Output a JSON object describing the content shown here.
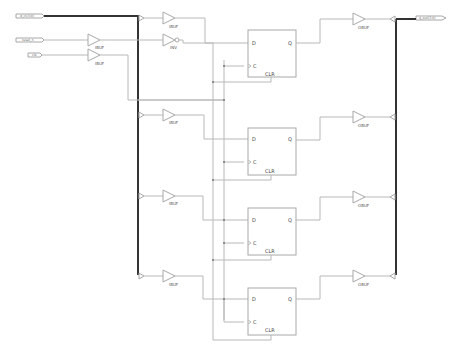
{
  "schematic": {
    "ports": {
      "in_bus": "d_in(3:0)",
      "reset": "reset_n",
      "clock": "clk",
      "out_bus": "q_out(3:0)"
    },
    "cells": {
      "ibuf": "IBUF",
      "inv": "INV",
      "obuf": "OBUF"
    },
    "flipflop": {
      "d": "D",
      "q": "Q",
      "c": "C",
      "clr": "CLR"
    }
  }
}
